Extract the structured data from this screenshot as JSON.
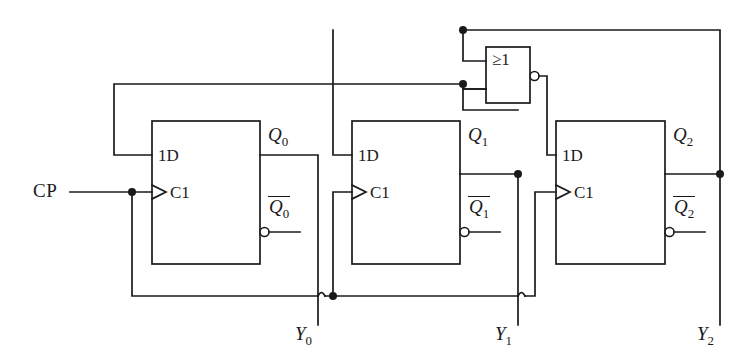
{
  "diagram": {
    "stroke_color": "#1a1a1a",
    "background": "#ffffff",
    "input": {
      "label": "CP",
      "name": "clock-pulse-input"
    },
    "gate": {
      "symbol": "≥1",
      "type": "nor",
      "has_output_bubble": true,
      "inputs": 2
    },
    "flipflops": [
      {
        "index": 0,
        "data_pin": "1D",
        "clock_pin": "C1",
        "q_label": "Q",
        "q_sub": "0",
        "qbar_label": "Q",
        "qbar_sub": "0",
        "output_label": "Y",
        "output_sub": "0"
      },
      {
        "index": 1,
        "data_pin": "1D",
        "clock_pin": "C1",
        "q_label": "Q",
        "q_sub": "1",
        "qbar_label": "Q",
        "qbar_sub": "1",
        "output_label": "Y",
        "output_sub": "1"
      },
      {
        "index": 2,
        "data_pin": "1D",
        "clock_pin": "C1",
        "q_label": "Q",
        "q_sub": "2",
        "qbar_label": "Q",
        "qbar_sub": "2",
        "output_label": "Y",
        "output_sub": "2"
      }
    ]
  }
}
